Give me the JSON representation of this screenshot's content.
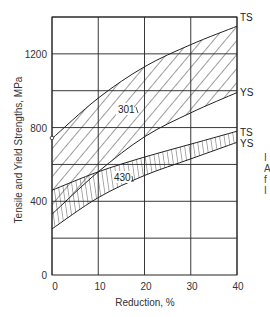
{
  "chart_data": {
    "type": "area",
    "title": "",
    "xlabel": "Reduction, %",
    "ylabel": "Tensile and Yield Strengths, MPa",
    "xlim": [
      0,
      40
    ],
    "ylim": [
      0,
      1400
    ],
    "grid": true,
    "x_ticks": [
      0,
      10,
      20,
      30,
      40
    ],
    "y_ticks": [
      0,
      400,
      800,
      1200
    ],
    "y_gridlines": [
      200,
      400,
      600,
      800,
      1000,
      1200,
      1400
    ],
    "x": [
      0,
      10,
      20,
      30,
      40
    ],
    "bands": [
      {
        "name": "301",
        "hatch": "diagonal",
        "upper": {
          "name": "TS",
          "values": [
            740,
            960,
            1130,
            1250,
            1350
          ]
        },
        "lower": {
          "name": "YS",
          "values": [
            330,
            560,
            750,
            880,
            990
          ]
        }
      },
      {
        "name": "430",
        "hatch": "vertical",
        "upper": {
          "name": "TS",
          "values": [
            460,
            560,
            640,
            710,
            780
          ]
        },
        "lower": {
          "name": "YS",
          "values": [
            250,
            420,
            540,
            630,
            720
          ]
        }
      }
    ],
    "annotations": [
      "301",
      "430",
      "TS",
      "YS",
      "TS",
      "YS"
    ]
  },
  "labels": {
    "xlabel": "Reduction, %",
    "ylabel": "Tensile and Yield Strengths, MPa",
    "ts": "TS",
    "ys": "YS",
    "series_301": "301",
    "series_430": "430",
    "ytick_0": "0",
    "ytick_400": "400",
    "ytick_800": "800",
    "ytick_1200": "1200",
    "xtick_0": "0",
    "xtick_10": "10",
    "xtick_20": "20",
    "xtick_30": "30",
    "xtick_40": "40"
  },
  "clipped_right_text": [
    "I",
    "A",
    "f",
    "I"
  ]
}
